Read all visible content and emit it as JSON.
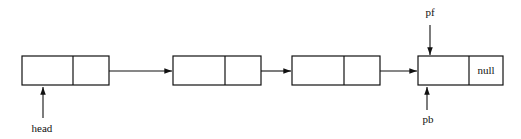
{
  "diagram": {
    "type": "linked-list",
    "nodes": [
      {
        "x": 22,
        "divider": 73,
        "w": 87,
        "next_text": ""
      },
      {
        "x": 173,
        "divider": 225,
        "w": 88,
        "next_text": ""
      },
      {
        "x": 292,
        "divider": 344,
        "w": 88,
        "next_text": ""
      },
      {
        "x": 418,
        "divider": 469,
        "w": 85,
        "next_text": "null"
      }
    ],
    "labels": {
      "head": "head",
      "pf": "pf",
      "pb": "pb",
      "null": "null"
    },
    "colors": {
      "stroke": "#111111",
      "background": "#ffffff"
    }
  }
}
